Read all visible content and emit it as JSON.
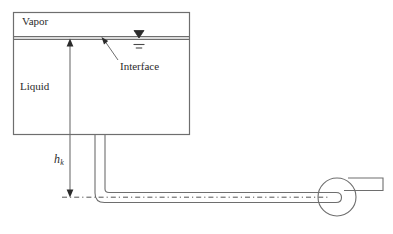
{
  "figure": {
    "type": "engineering-schematic",
    "background_color": "#ffffff",
    "line_color": "#6e6e6e",
    "text_color": "#2b2b2b"
  },
  "tank": {
    "vapor_label": "Vapor",
    "liquid_label": "Liquid",
    "interface_label": "Interface",
    "x": 13,
    "y": 12,
    "width": 177,
    "height": 123,
    "interface_y": 38
  },
  "dimension": {
    "symbol": "h",
    "subscript": "k",
    "measures": "interface-to-pump-centerline",
    "top_y": 39,
    "bottom_y": 197,
    "x": 70
  },
  "pipe": {
    "vertical_x_left": 95,
    "vertical_x_right": 105,
    "centerline_y": 197,
    "elbow_radius": 9,
    "style": "dash-dot-centerline"
  },
  "pump": {
    "center_x": 337,
    "center_y": 197,
    "radius": 19,
    "discharge_label": ""
  },
  "level_symbol": {
    "name": "liquid-level-marker",
    "x": 139,
    "y": 38,
    "description": "filled down-triangle over two short horizontal dashes"
  }
}
